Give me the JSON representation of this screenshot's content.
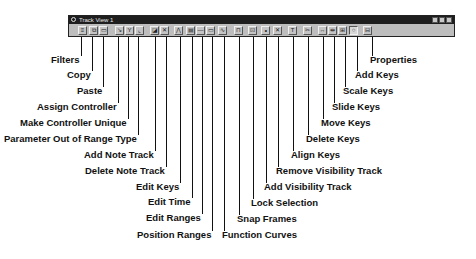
{
  "window": {
    "title": "Track View 1",
    "controls": [
      "minimize",
      "maximize",
      "close"
    ]
  },
  "toolbar": {
    "buttons": [
      {
        "name": "filters",
        "icon": "filter-icon",
        "glyph": "≡",
        "x": 81
      },
      {
        "name": "copy",
        "icon": "copy-icon",
        "glyph": "⧉",
        "x": 92
      },
      {
        "name": "paste",
        "icon": "paste-icon",
        "glyph": "▭",
        "x": 102
      },
      {
        "name": "assign-controller",
        "icon": "assign-controller-icon",
        "glyph": "↘",
        "x": 118
      },
      {
        "name": "make-controller-unique",
        "icon": "make-unique-icon",
        "glyph": "Y",
        "x": 128
      },
      {
        "name": "parameter-out-of-range-type",
        "icon": "out-of-range-icon",
        "glyph": "⌞",
        "x": 138
      },
      {
        "name": "add-note-track",
        "icon": "add-note-track-icon",
        "glyph": "◪",
        "x": 153
      },
      {
        "name": "delete-note-track",
        "icon": "delete-note-track-icon",
        "glyph": "✕",
        "x": 163
      },
      {
        "name": "edit-keys",
        "icon": "edit-keys-icon",
        "glyph": "⋀",
        "x": 177
      },
      {
        "name": "edit-time",
        "icon": "edit-time-icon",
        "glyph": "▤",
        "x": 189
      },
      {
        "name": "edit-ranges",
        "icon": "edit-ranges-icon",
        "glyph": "—",
        "x": 199
      },
      {
        "name": "position-ranges",
        "icon": "position-ranges-icon",
        "glyph": "▭",
        "x": 209
      },
      {
        "name": "function-curves",
        "icon": "function-curves-icon",
        "glyph": "∿",
        "x": 221
      },
      {
        "name": "snap-frames",
        "icon": "snap-frames-icon",
        "glyph": "⊓",
        "x": 237
      },
      {
        "name": "lock-selection",
        "icon": "lock-icon",
        "glyph": "⊡",
        "x": 251
      },
      {
        "name": "add-visibility-track",
        "icon": "add-visibility-track-icon",
        "glyph": "∘",
        "x": 264
      },
      {
        "name": "remove-visibility-track",
        "icon": "remove-visibility-track-icon",
        "glyph": "✕",
        "x": 276
      },
      {
        "name": "align-keys",
        "icon": "align-keys-icon",
        "glyph": "T",
        "x": 291
      },
      {
        "name": "delete-keys",
        "icon": "delete-keys-icon",
        "glyph": "✂",
        "x": 306
      },
      {
        "name": "move-keys",
        "icon": "move-keys-icon",
        "glyph": "↔",
        "x": 321
      },
      {
        "name": "slide-keys",
        "icon": "slide-keys-icon",
        "glyph": "⇹",
        "x": 331
      },
      {
        "name": "scale-keys",
        "icon": "scale-keys-icon",
        "glyph": "⊞",
        "x": 341
      },
      {
        "name": "add-keys",
        "icon": "add-keys-icon",
        "glyph": "○",
        "x": 352,
        "pressed": true
      },
      {
        "name": "properties",
        "icon": "properties-icon",
        "glyph": "⊟",
        "x": 366
      }
    ]
  },
  "callouts": [
    {
      "label": "Filters",
      "x": 81,
      "label_y": 54,
      "label_x": 53
    },
    {
      "label": "Copy",
      "x": 92,
      "label_y": 69,
      "label_x": 74
    },
    {
      "label": "Paste",
      "x": 103,
      "label_y": 85,
      "label_x": 84
    },
    {
      "label": "Assign Controller",
      "x": 118,
      "label_y": 101,
      "label_x": 48
    },
    {
      "label": "Make Controller Unique",
      "x": 128,
      "label_y": 117,
      "label_x": 31
    },
    {
      "label": "Parameter Out of Range Type",
      "x": 138,
      "label_y": 133,
      "label_x": 20
    },
    {
      "label": "Add Note Track",
      "x": 155,
      "label_y": 149,
      "label_x": 93
    },
    {
      "label": "Delete Note Track",
      "x": 166,
      "label_y": 165,
      "label_x": 92
    },
    {
      "label": "Edit Keys",
      "x": 180,
      "label_y": 181,
      "label_x": 143
    },
    {
      "label": "Edit Time",
      "x": 192,
      "label_y": 196,
      "label_x": 156
    },
    {
      "label": "Edit Ranges",
      "x": 202,
      "label_y": 212,
      "label_x": 154
    },
    {
      "label": "Position Ranges",
      "x": 212,
      "label_y": 229,
      "label_x": 146
    },
    {
      "label": "Function Curves",
      "x": 224,
      "label_y": 229,
      "label_x": 222
    },
    {
      "label": "Snap Frames",
      "x": 239,
      "label_y": 213,
      "label_x": 237
    },
    {
      "label": "Lock Selection",
      "x": 253,
      "label_y": 197,
      "label_x": 251
    },
    {
      "label": "Add Visibility Track",
      "x": 266,
      "label_y": 181,
      "label_x": 264
    },
    {
      "label": "Remove Visibility Track",
      "x": 278,
      "label_y": 165,
      "label_x": 276
    },
    {
      "label": "Align Keys",
      "x": 293,
      "label_y": 149,
      "label_x": 291
    },
    {
      "label": "Delete Keys",
      "x": 308,
      "label_y": 133,
      "label_x": 306
    },
    {
      "label": "Move Keys",
      "x": 323,
      "label_y": 117,
      "label_x": 321
    },
    {
      "label": "Slide Keys",
      "x": 334,
      "label_y": 101,
      "label_x": 332
    },
    {
      "label": "Scale Keys",
      "x": 345,
      "label_y": 85,
      "label_x": 343
    },
    {
      "label": "Add Keys",
      "x": 357,
      "label_y": 69,
      "label_x": 353
    },
    {
      "label": "Properties",
      "x": 372,
      "label_y": 54,
      "label_x": 370
    }
  ]
}
